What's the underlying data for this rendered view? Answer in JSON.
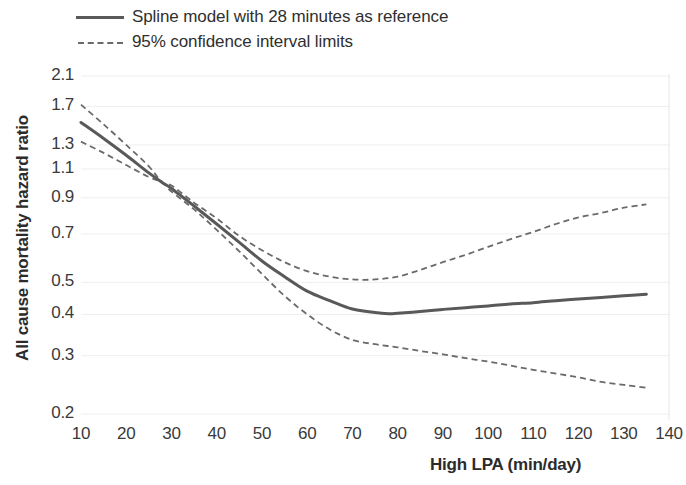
{
  "legend": {
    "items": [
      {
        "label": "Spline model with 28 minutes as reference",
        "style": "solid",
        "color": "#595959"
      },
      {
        "label": "95% confidence interval limits",
        "style": "dashed",
        "color": "#6a6a6a"
      }
    ]
  },
  "axes": {
    "ylabel": "All cause mortality hazard ratio",
    "xlabel": "High LPA (min/day)",
    "yticks": [
      "2.1",
      "1.7",
      "1.3",
      "1.1",
      "0.9",
      "0.7",
      "0.5",
      "0.4",
      "0.3",
      "0.2"
    ],
    "xticks": [
      "10",
      "20",
      "30",
      "40",
      "50",
      "60",
      "70",
      "80",
      "90",
      "100",
      "110",
      "120",
      "130",
      "140"
    ]
  },
  "chart_data": {
    "type": "line",
    "title": "",
    "subtitle": "",
    "xlabel": "High LPA (min/day)",
    "ylabel": "All cause mortality hazard ratio",
    "yscale": "log",
    "xlim": [
      10,
      140
    ],
    "ylim": [
      0.2,
      2.1
    ],
    "grid": true,
    "grid_axis": "y",
    "legend_position": "top-left",
    "xtick_values": [
      10,
      20,
      30,
      40,
      50,
      60,
      70,
      80,
      90,
      100,
      110,
      120,
      130,
      140
    ],
    "ytick_values": [
      2.1,
      1.7,
      1.3,
      1.1,
      0.9,
      0.7,
      0.5,
      0.4,
      0.3,
      0.2
    ],
    "reference_point": {
      "x": 28,
      "y": 1.0
    },
    "series": [
      {
        "name": "Spline model with 28 minutes as reference",
        "style": "solid",
        "color": "#595959",
        "x": [
          10,
          15,
          20,
          25,
          28,
          30,
          35,
          40,
          45,
          50,
          55,
          60,
          65,
          70,
          75,
          78,
          80,
          85,
          90,
          95,
          100,
          105,
          110,
          115,
          120,
          125,
          130,
          135
        ],
        "values": [
          1.52,
          1.36,
          1.21,
          1.07,
          1.0,
          0.96,
          0.85,
          0.75,
          0.66,
          0.58,
          0.52,
          0.47,
          0.44,
          0.415,
          0.405,
          0.402,
          0.403,
          0.408,
          0.414,
          0.419,
          0.424,
          0.43,
          0.434,
          0.44,
          0.445,
          0.45,
          0.455,
          0.46
        ]
      },
      {
        "name": "95% confidence interval upper limit",
        "style": "dashed",
        "color": "#6a6a6a",
        "x": [
          10,
          15,
          20,
          25,
          28,
          30,
          35,
          40,
          45,
          50,
          55,
          60,
          65,
          70,
          75,
          80,
          85,
          90,
          95,
          100,
          105,
          110,
          115,
          120,
          125,
          130,
          135
        ],
        "values": [
          1.72,
          1.5,
          1.3,
          1.12,
          1.0,
          0.98,
          0.87,
          0.78,
          0.69,
          0.625,
          0.575,
          0.54,
          0.52,
          0.51,
          0.51,
          0.52,
          0.545,
          0.575,
          0.605,
          0.64,
          0.675,
          0.71,
          0.75,
          0.785,
          0.81,
          0.84,
          0.86
        ]
      },
      {
        "name": "95% confidence interval lower limit",
        "style": "dashed",
        "color": "#6a6a6a",
        "x": [
          10,
          15,
          20,
          25,
          28,
          30,
          35,
          40,
          45,
          50,
          55,
          60,
          65,
          70,
          75,
          80,
          85,
          90,
          95,
          100,
          105,
          110,
          115,
          120,
          125,
          130,
          135
        ],
        "values": [
          1.33,
          1.23,
          1.13,
          1.04,
          1.0,
          0.94,
          0.83,
          0.72,
          0.62,
          0.53,
          0.455,
          0.4,
          0.36,
          0.335,
          0.325,
          0.318,
          0.31,
          0.303,
          0.295,
          0.288,
          0.28,
          0.272,
          0.265,
          0.258,
          0.25,
          0.245,
          0.24
        ]
      }
    ]
  },
  "geometry": {
    "plot_left": 81,
    "plot_right": 669,
    "plot_top": 74,
    "plot_bottom": 420,
    "y_pixel_map": [
      {
        "value": 2.1,
        "y": 76
      },
      {
        "value": 0.2,
        "y": 414
      }
    ]
  }
}
